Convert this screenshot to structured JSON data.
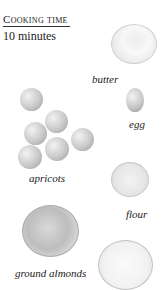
{
  "header": {
    "title": "Cooking time",
    "value": "10 minutes"
  },
  "ingredients": [
    {
      "name": "butter"
    },
    {
      "name": "egg"
    },
    {
      "name": "apricots"
    },
    {
      "name": "flour"
    },
    {
      "name": "ground almonds"
    },
    {
      "name": "sugar-bowl"
    }
  ]
}
